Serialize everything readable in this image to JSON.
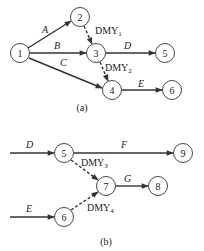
{
  "diagram_a": {
    "caption": "(a)",
    "nodes": [
      {
        "id": "1",
        "label": "1"
      },
      {
        "id": "2",
        "label": "2"
      },
      {
        "id": "3",
        "label": "3"
      },
      {
        "id": "4",
        "label": "4"
      },
      {
        "id": "5",
        "label": "5"
      },
      {
        "id": "6",
        "label": "6"
      }
    ],
    "edges": [
      {
        "from": "1",
        "to": "2",
        "label": "A",
        "type": "activity"
      },
      {
        "from": "1",
        "to": "3",
        "label": "B",
        "type": "activity"
      },
      {
        "from": "1",
        "to": "4",
        "label": "C",
        "type": "activity"
      },
      {
        "from": "2",
        "to": "3",
        "label": "DMY",
        "sub": "1",
        "type": "dummy"
      },
      {
        "from": "3",
        "to": "5",
        "label": "D",
        "type": "activity"
      },
      {
        "from": "3",
        "to": "4",
        "label": "DMY",
        "sub": "2",
        "type": "dummy"
      },
      {
        "from": "4",
        "to": "6",
        "label": "E",
        "type": "activity"
      }
    ]
  },
  "diagram_b": {
    "caption": "(b)",
    "nodes": [
      {
        "id": "5",
        "label": "5"
      },
      {
        "id": "6",
        "label": "6"
      },
      {
        "id": "7",
        "label": "7"
      },
      {
        "id": "8",
        "label": "8"
      },
      {
        "id": "9",
        "label": "9"
      }
    ],
    "edges": [
      {
        "from": null,
        "to": "5",
        "label": "D",
        "type": "activity"
      },
      {
        "from": null,
        "to": "6",
        "label": "E",
        "type": "activity"
      },
      {
        "from": "5",
        "to": "9",
        "label": "F",
        "type": "activity"
      },
      {
        "from": "5",
        "to": "7",
        "label": "DMY",
        "sub": "3",
        "type": "dummy"
      },
      {
        "from": "6",
        "to": "7",
        "label": "DMY",
        "sub": "4",
        "type": "dummy"
      },
      {
        "from": "7",
        "to": "8",
        "label": "G",
        "type": "activity"
      }
    ]
  }
}
